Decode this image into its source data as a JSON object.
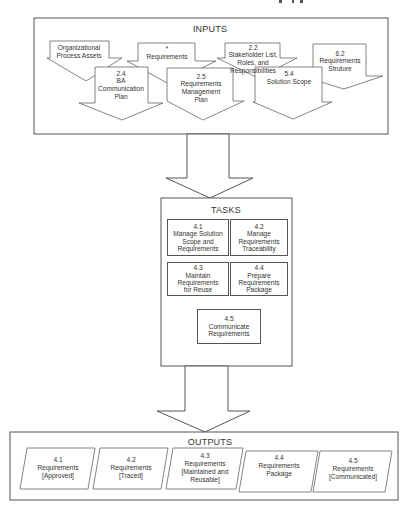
{
  "diagram": {
    "header_fragment": "...Category Input...",
    "inputs": {
      "title": "INPUTS",
      "items": [
        {
          "id": "org-process-assets",
          "lines": [
            "Organizational",
            "Process Assets"
          ]
        },
        {
          "id": "requirements",
          "lines": [
            "*",
            "Requirements"
          ]
        },
        {
          "id": "stakeholder-list",
          "lines": [
            "2.2",
            "Stakeholder List,",
            "Roles, and",
            "Responsibilities"
          ]
        },
        {
          "id": "requirements-structure",
          "lines": [
            "6.2",
            "Requirements",
            "Struture"
          ]
        },
        {
          "id": "ba-communication-plan",
          "lines": [
            "2.4",
            "BA",
            "Communication",
            "Plan"
          ]
        },
        {
          "id": "requirements-management-plan",
          "lines": [
            "2.5",
            "Requirements",
            "Management",
            "Plan"
          ]
        },
        {
          "id": "solution-scope",
          "lines": [
            "5.4",
            "Solution Scope"
          ]
        }
      ]
    },
    "tasks": {
      "title": "TASKS",
      "items": [
        {
          "id": "4-1",
          "lines": [
            "4.1",
            "Manage Solution",
            "Scope and",
            "Requirements"
          ]
        },
        {
          "id": "4-2",
          "lines": [
            "4.2",
            "Manage",
            "Requirements",
            "Traceability"
          ]
        },
        {
          "id": "4-3",
          "lines": [
            "4.3",
            "Maintain",
            "Requirements",
            "for Reuse"
          ]
        },
        {
          "id": "4-4",
          "lines": [
            "4.4",
            "Prepare",
            "Requirements",
            "Package"
          ]
        },
        {
          "id": "4-5",
          "lines": [
            "4.5",
            "Communicate",
            "Requirements"
          ]
        }
      ]
    },
    "outputs": {
      "title": "OUTPUTS",
      "items": [
        {
          "id": "4-1",
          "lines": [
            "4.1",
            "Requirements",
            "[Approved]"
          ]
        },
        {
          "id": "4-2",
          "lines": [
            "4.2",
            "Requirements",
            "[Traced]"
          ]
        },
        {
          "id": "4-3",
          "lines": [
            "4.3",
            "Requirements",
            "[Maintained and",
            "Reusable]"
          ]
        },
        {
          "id": "4-4",
          "lines": [
            "4.4",
            "Requirements",
            "Package"
          ]
        },
        {
          "id": "4-5",
          "lines": [
            "4.5",
            "Requirements",
            "[Communicated]"
          ]
        }
      ]
    },
    "colors": {
      "stroke": "#555555",
      "text": "#333333",
      "background": "#ffffff"
    }
  }
}
